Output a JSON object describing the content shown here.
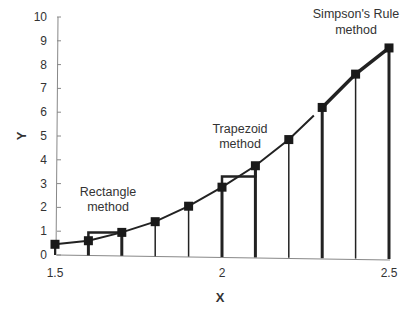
{
  "chart_data": {
    "type": "line",
    "title": "",
    "xlabel": "X",
    "ylabel": "Y",
    "xlim": [
      1.5,
      2.5
    ],
    "ylim": [
      0,
      10
    ],
    "x_ticks": [
      "1.5",
      "2",
      "2.5"
    ],
    "y_ticks": [
      "0",
      "1",
      "2",
      "3",
      "4",
      "5",
      "6",
      "7",
      "8",
      "9",
      "10"
    ],
    "grid": false,
    "legend": null,
    "x": [
      1.5,
      1.6,
      1.7,
      1.8,
      1.9,
      2.0,
      2.1,
      2.2,
      2.3,
      2.4,
      2.5
    ],
    "series": [
      {
        "name": "f(x)",
        "values": [
          0.45,
          0.6,
          0.95,
          1.4,
          2.05,
          2.85,
          3.75,
          4.85,
          6.2,
          7.6,
          8.7
        ]
      }
    ],
    "annotations": [
      {
        "text_line1": "Rectangle",
        "text_line2": "method",
        "region_x": [
          1.6,
          1.7
        ],
        "height": 0.95
      },
      {
        "text_line1": "Trapezoid",
        "text_line2": "method",
        "region_x": [
          2.0,
          2.1
        ],
        "height": 3.3
      },
      {
        "text_line1": "Simpson's Rule",
        "text_line2": "method",
        "region_x": [
          2.3,
          2.5
        ]
      }
    ]
  },
  "labels": {
    "x_axis_title": "X",
    "y_axis_title": "Y",
    "rect_1": "Rectangle",
    "rect_2": "method",
    "trap_1": "Trapezoid",
    "trap_2": "method",
    "simp_1": "Simpson's Rule",
    "simp_2": "method"
  }
}
